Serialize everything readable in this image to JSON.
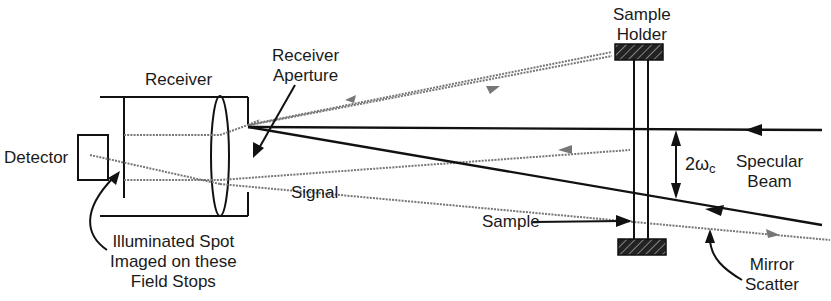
{
  "diagram": {
    "type": "optical-schematic",
    "labels": {
      "receiver": "Receiver",
      "receiver_aperture_1": "Receiver",
      "receiver_aperture_2": "Aperture",
      "detector": "Detector",
      "signal": "Signal",
      "sample_holder_1": "Sample",
      "sample_holder_2": "Holder",
      "angle": "2ω",
      "angle_sub": "c",
      "specular_1": "Specular",
      "specular_2": "Beam",
      "sample": "Sample",
      "mirror_1": "Mirror",
      "mirror_2": "Scatter",
      "spot_1": "Illuminated Spot",
      "spot_2": "Imaged on these",
      "spot_3": "Field Stops"
    },
    "colors": {
      "line": "#111111",
      "scatter": "#7a7a7a",
      "background": "#ffffff"
    }
  }
}
